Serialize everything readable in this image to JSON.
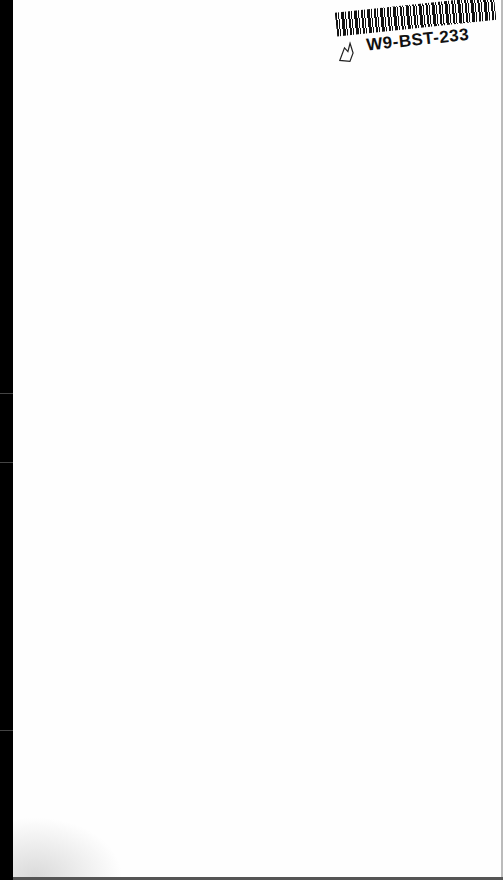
{
  "document": {
    "type": "scanned blank page",
    "sticker": {
      "code": "W9-BST-233",
      "icon": "hand-drawn-glyph-icon"
    }
  }
}
